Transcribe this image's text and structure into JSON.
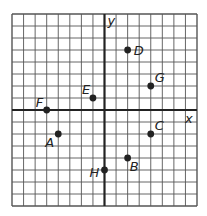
{
  "chart_data": {
    "type": "scatter",
    "title": "",
    "xlabel": "x",
    "ylabel": "y",
    "xlim": [
      -8,
      8
    ],
    "ylim": [
      -8,
      8
    ],
    "grid": true,
    "grid_step": 1,
    "points": [
      {
        "label": "A",
        "x": -4,
        "y": -2
      },
      {
        "label": "B",
        "x": 2,
        "y": -4
      },
      {
        "label": "C",
        "x": 4,
        "y": -2
      },
      {
        "label": "D",
        "x": 2,
        "y": 5
      },
      {
        "label": "E",
        "x": -1,
        "y": 1
      },
      {
        "label": "F",
        "x": -5,
        "y": 0
      },
      {
        "label": "G",
        "x": 4,
        "y": 2
      },
      {
        "label": "H",
        "x": 0,
        "y": -5
      }
    ]
  },
  "axes": {
    "x_label": "x",
    "y_label": "y"
  },
  "colors": {
    "grid": "#555555",
    "axis": "#222222",
    "point": "#222222",
    "background": "#ffffff"
  }
}
